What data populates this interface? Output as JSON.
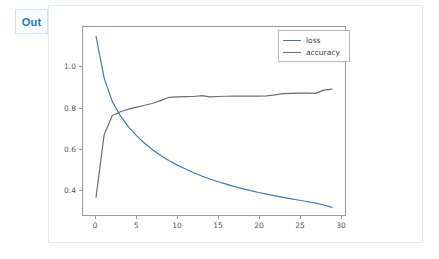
{
  "notebook": {
    "prompt_label": "Out",
    "prompt_color": "#2077c4",
    "output_border_color": "#dceef2"
  },
  "chart_data": {
    "type": "line",
    "title": "",
    "xlabel": "",
    "ylabel": "",
    "xlim": [
      -1.6,
      30.6
    ],
    "ylim": [
      0.275,
      1.195
    ],
    "xticks": [
      0,
      5,
      10,
      15,
      20,
      25,
      30
    ],
    "xtick_labels": [
      "0",
      "5",
      "10",
      "15",
      "20",
      "25",
      "30"
    ],
    "yticks": [
      0.4,
      0.6,
      0.8,
      1.0
    ],
    "ytick_labels": [
      "0.4",
      "0.6",
      "0.8",
      "1.0"
    ],
    "grid": false,
    "legend_position": "upper right",
    "legend_entries": [
      "loss",
      "accuracy"
    ],
    "x": [
      0,
      1,
      2,
      3,
      4,
      5,
      6,
      7,
      8,
      9,
      10,
      11,
      12,
      13,
      14,
      15,
      16,
      17,
      18,
      19,
      20,
      21,
      22,
      23,
      24,
      25,
      26,
      27,
      28,
      29
    ],
    "series": [
      {
        "name": "loss",
        "color": "#3d7ea6",
        "values": [
          1.149,
          0.945,
          0.83,
          0.76,
          0.706,
          0.662,
          0.625,
          0.593,
          0.565,
          0.541,
          0.519,
          0.5,
          0.482,
          0.466,
          0.451,
          0.438,
          0.426,
          0.414,
          0.404,
          0.394,
          0.385,
          0.377,
          0.369,
          0.361,
          0.354,
          0.347,
          0.34,
          0.333,
          0.324,
          0.312
        ]
      },
      {
        "name": "accuracy",
        "color": "#6e6e6e",
        "values": [
          0.362,
          0.668,
          0.762,
          0.78,
          0.793,
          0.803,
          0.812,
          0.822,
          0.836,
          0.851,
          0.853,
          0.854,
          0.855,
          0.859,
          0.853,
          0.855,
          0.856,
          0.857,
          0.857,
          0.857,
          0.857,
          0.858,
          0.863,
          0.869,
          0.87,
          0.871,
          0.871,
          0.87,
          0.886,
          0.891
        ]
      }
    ]
  }
}
